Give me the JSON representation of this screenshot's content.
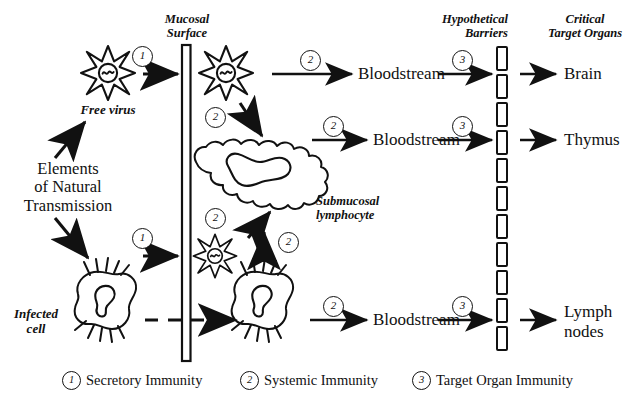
{
  "figure": {
    "type": "biomedical-pathway-diagram",
    "ink_color": "#111111",
    "background_color": "#ffffff"
  },
  "column_headers": [
    {
      "id": "mucosal-surface",
      "text": "Mucosal\nSurface",
      "style": "italic"
    },
    {
      "id": "hypothetical-barriers",
      "text": "Hypothetical\nBarriers",
      "style": "italic"
    },
    {
      "id": "critical-target-organs",
      "text": "Critical\nTarget Organs",
      "style": "italic"
    }
  ],
  "entities": {
    "free_virus": {
      "label": "Free virus",
      "style": "italic",
      "glyph": "spiky-virus-icon"
    },
    "transmission": {
      "label": "Elements\nof Natural\nTransmission",
      "style": "roman"
    },
    "infected_cell": {
      "label": "Infected\ncell",
      "style": "italic",
      "glyph": "dendritic-cell-icon"
    },
    "submucosal_lymphocyte": {
      "label": "Submucosal\nlymphocyte",
      "style": "italic",
      "glyph": "amoeboid-lymphocyte-icon"
    },
    "luminal_virus": {
      "label": "",
      "glyph": "spiky-virus-icon"
    },
    "submucosal_virus": {
      "label": "",
      "glyph": "spiky-virus-icon"
    },
    "submucosal_infected_cell": {
      "label": "",
      "glyph": "dendritic-cell-icon"
    }
  },
  "rows": [
    {
      "id": "brain-row",
      "bloodstream": "Bloodstream",
      "step": "3",
      "organ": "Brain"
    },
    {
      "id": "thymus-row",
      "bloodstream": "Bloodstream",
      "step": "3",
      "organ": "Thymus"
    },
    {
      "id": "lymph-row",
      "bloodstream": "Bloodstream",
      "step": "3",
      "organ": "Lymph\nnodes"
    }
  ],
  "step_markers": [
    {
      "id": "m1-virus-entry",
      "value": "1"
    },
    {
      "id": "m1-cell-entry",
      "value": "1"
    },
    {
      "id": "m2-virus-to-lymphocyte",
      "value": "2"
    },
    {
      "id": "m2-virus-infect",
      "value": "2"
    },
    {
      "id": "m2-cell-to-virus",
      "value": "2"
    },
    {
      "id": "m2-cell-to-lymphocyte",
      "value": "2"
    },
    {
      "id": "m2-lymphocyte-to-blood-1",
      "value": "2"
    },
    {
      "id": "m2-lymphocyte-to-blood-2",
      "value": "2"
    },
    {
      "id": "m2-cell-to-blood",
      "value": "2"
    },
    {
      "id": "m3-brain",
      "value": "3"
    },
    {
      "id": "m3-thymus",
      "value": "3"
    },
    {
      "id": "m3-lymph",
      "value": "3"
    }
  ],
  "legend": [
    {
      "marker": "1",
      "label": "Secretory Immunity"
    },
    {
      "marker": "2",
      "label": "Systemic Immunity"
    },
    {
      "marker": "3",
      "label": "Target Organ Immunity"
    }
  ]
}
